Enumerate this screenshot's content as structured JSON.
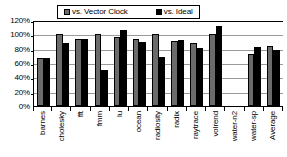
{
  "chart_data": {
    "type": "bar",
    "title": "",
    "xlabel": "",
    "ylabel": "",
    "ylim": [
      0,
      120
    ],
    "ytick_labels": [
      "120%",
      "100%",
      "80%",
      "60%",
      "40%",
      "20%",
      "0%"
    ],
    "ytick_values": [
      120,
      100,
      80,
      60,
      40,
      20,
      0
    ],
    "grid": true,
    "legend_position": "top-center",
    "categories": [
      "barnes",
      "cholesky",
      "fft",
      "fmm",
      "lu",
      "ocean",
      "radiosity",
      "radix",
      "raytrace",
      "volrend",
      "water-n2",
      "water-sp",
      "Average"
    ],
    "series": [
      {
        "name": "vs. Vector Clock",
        "color": "#6b6b6b",
        "values": [
          67,
          100,
          93,
          100,
          96,
          94,
          100,
          91,
          88,
          101,
          null,
          73,
          84
        ]
      },
      {
        "name": "vs. Ideal",
        "color": "#000000",
        "values": [
          67,
          88,
          93,
          50,
          106,
          89,
          68,
          92,
          81,
          111,
          null,
          83,
          78
        ]
      }
    ]
  },
  "legend": {
    "items": [
      {
        "label": "vs. Vector Clock",
        "swatch": "series-vector-clock"
      },
      {
        "label": "vs. Ideal",
        "swatch": "series-ideal"
      }
    ]
  }
}
